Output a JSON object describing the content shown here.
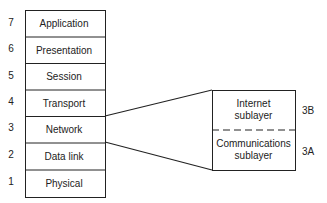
{
  "layers": [
    {
      "num": "7",
      "label": "Application"
    },
    {
      "num": "6",
      "label": "Presentation"
    },
    {
      "num": "5",
      "label": "Session"
    },
    {
      "num": "4",
      "label": "Transport"
    },
    {
      "num": "3",
      "label": "Network"
    },
    {
      "num": "2",
      "label": "Data link"
    },
    {
      "num": "1",
      "label": "Physical"
    }
  ],
  "sublayers": [
    {
      "id": "3B",
      "line1": "Internet",
      "line2": "sublayer"
    },
    {
      "id": "3A",
      "line1": "Communications",
      "line2": "sublayer"
    }
  ]
}
